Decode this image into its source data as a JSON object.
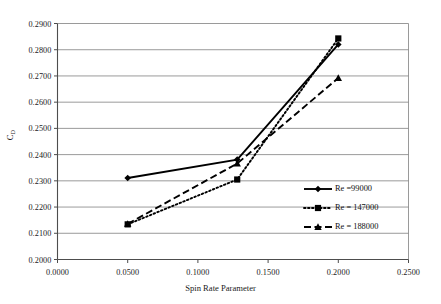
{
  "chart_data": {
    "type": "line",
    "title": "",
    "xlabel": "Spin Rate Parameter",
    "ylabel": "CD",
    "ylabel_base": "C",
    "ylabel_sub": "D",
    "xlim": [
      0.0,
      0.25
    ],
    "ylim": [
      0.2,
      0.29
    ],
    "grid": "horizontal",
    "legend_position": "right-inside",
    "x_ticks": [
      "0.0000",
      "0.0500",
      "0.1000",
      "0.1500",
      "0.2000",
      "0.2500"
    ],
    "x_tick_values": [
      0.0,
      0.05,
      0.1,
      0.15,
      0.2,
      0.25
    ],
    "y_ticks": [
      "0.2000",
      "0.2100",
      "0.2200",
      "0.2300",
      "0.2400",
      "0.2500",
      "0.2600",
      "0.2700",
      "0.2800",
      "0.2900"
    ],
    "y_tick_values": [
      0.2,
      0.21,
      0.22,
      0.23,
      0.24,
      0.25,
      0.26,
      0.27,
      0.28,
      0.29
    ],
    "series": [
      {
        "name": "Re =99000",
        "marker": "diamond",
        "linestyle": "solid",
        "color": "#000000",
        "x": [
          0.05,
          0.128,
          0.2
        ],
        "values": [
          0.2311,
          0.2381,
          0.282
        ]
      },
      {
        "name": "Re = 147000",
        "marker": "square",
        "linestyle": "dotted",
        "color": "#000000",
        "x": [
          0.05,
          0.128,
          0.2
        ],
        "values": [
          0.2134,
          0.2305,
          0.2843
        ]
      },
      {
        "name": "Re = 188000",
        "marker": "triangle",
        "linestyle": "dashed",
        "color": "#000000",
        "x": [
          0.05,
          0.128,
          0.2
        ],
        "values": [
          0.2136,
          0.2366,
          0.2692
        ]
      }
    ]
  },
  "axes": {
    "x_title": "Spin Rate Parameter",
    "y_title_base": "C",
    "y_title_sub": "D"
  },
  "legend": {
    "items": [
      {
        "label": "Re =99000"
      },
      {
        "label": "Re = 147000"
      },
      {
        "label": "Re = 188000"
      }
    ]
  },
  "colors": {
    "axis": "#4d4d4d",
    "grid": "#808080",
    "series": "#000000",
    "background": "#ffffff"
  }
}
